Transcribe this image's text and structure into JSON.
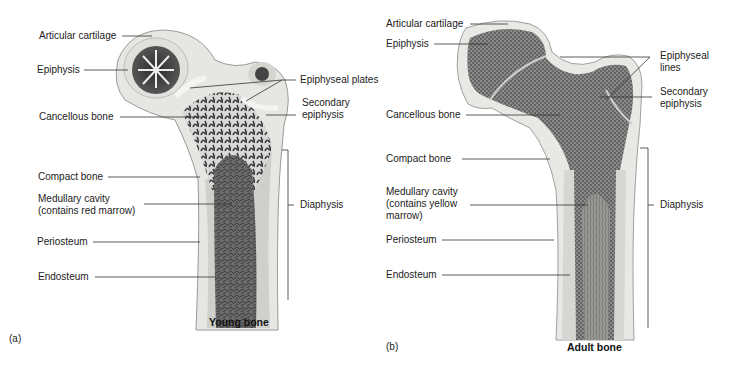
{
  "figures": [
    {
      "panel": "(a)",
      "caption": "Young bone",
      "labels": {
        "articular_cartilage": "Articular cartilage",
        "epiphysis": "Epiphysis",
        "cancellous_bone": "Cancellous bone",
        "compact_bone": "Compact bone",
        "medullary_cavity": "Medullary cavity\n(contains red marrow)",
        "periosteum": "Periosteum",
        "endosteum": "Endosteum",
        "epiphyseal_plates": "Epiphyseal plates",
        "secondary_epiphysis": "Secondary\nepiphysis",
        "diaphysis": "Diaphysis"
      }
    },
    {
      "panel": "(b)",
      "caption": "Adult bone",
      "labels": {
        "articular_cartilage": "Articular cartilage",
        "epiphysis": "Epiphysis",
        "cancellous_bone": "Cancellous bone",
        "compact_bone": "Compact bone",
        "medullary_cavity": "Medullary cavity\n(contains yellow\nmarrow)",
        "periosteum": "Periosteum",
        "endosteum": "Endosteum",
        "epiphyseal_lines": "Epiphyseal\nlines",
        "secondary_epiphysis": "Secondary\nepiphysis",
        "diaphysis": "Diaphysis"
      }
    }
  ]
}
